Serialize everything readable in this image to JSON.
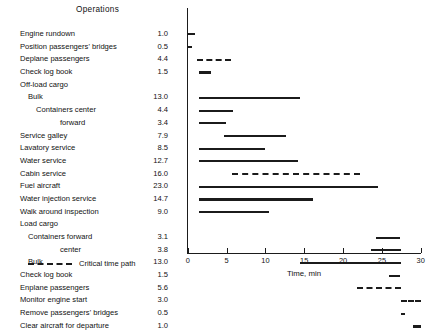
{
  "header": {
    "column_title": "Operations"
  },
  "axis": {
    "x_title": "Time, min",
    "x_ticks": [
      "0",
      "5",
      "10",
      "15",
      "20",
      "25",
      "30"
    ]
  },
  "legend": {
    "label": "Critical time path",
    "style": "dashed"
  },
  "rows": [
    {
      "label": "Engine rundown",
      "indent": 0,
      "value": "1.0"
    },
    {
      "label": "Position passengers' bridges",
      "indent": 0,
      "value": "0.5"
    },
    {
      "label": "Deplane passengers",
      "indent": 0,
      "value": "4.4"
    },
    {
      "label": "Check log book",
      "indent": 0,
      "value": "1.5"
    },
    {
      "label": "Off-load cargo",
      "indent": 0,
      "value": ""
    },
    {
      "label": "Bulk",
      "indent": 1,
      "value": "13.0"
    },
    {
      "label": "Containers center",
      "indent": 2,
      "value": "4.4"
    },
    {
      "label": "forward",
      "indent": 3,
      "value": "3.4"
    },
    {
      "label": "Service galley",
      "indent": 0,
      "value": "7.9"
    },
    {
      "label": "Lavatory service",
      "indent": 0,
      "value": "8.5"
    },
    {
      "label": "Water service",
      "indent": 0,
      "value": "12.7"
    },
    {
      "label": "Cabin service",
      "indent": 0,
      "value": "16.0"
    },
    {
      "label": "Fuel aircraft",
      "indent": 0,
      "value": "23.0"
    },
    {
      "label": "Water injection service",
      "indent": 0,
      "value": "14.7"
    },
    {
      "label": "Walk around inspection",
      "indent": 0,
      "value": "9.0"
    },
    {
      "label": "Load cargo",
      "indent": 0,
      "value": ""
    },
    {
      "label": "Containers forward",
      "indent": 1,
      "value": "3.1"
    },
    {
      "label": "center",
      "indent": 3,
      "value": "3.8"
    },
    {
      "label": "Bulk",
      "indent": 1,
      "value": "13.0"
    },
    {
      "label": "Check log book",
      "indent": 0,
      "value": "1.5"
    },
    {
      "label": "Enplane passengers",
      "indent": 0,
      "value": "5.6"
    },
    {
      "label": "Monitor engine start",
      "indent": 0,
      "value": "3.0"
    },
    {
      "label": "Remove passengers' bridges",
      "indent": 0,
      "value": "0.5"
    },
    {
      "label": "Clear aircraft for departure",
      "indent": 0,
      "value": "1.0"
    }
  ],
  "chart_data": {
    "type": "bar",
    "orientation": "horizontal-gantt",
    "title": "Operations",
    "xlabel": "Time, min",
    "ylabel": "",
    "xlim": [
      0,
      30
    ],
    "xticks": [
      0,
      5,
      10,
      15,
      20,
      25,
      30
    ],
    "grid": false,
    "legend": [
      {
        "name": "Critical time path",
        "style": "dashed"
      }
    ],
    "categories": [
      "Engine rundown",
      "Position passengers' bridges",
      "Deplane passengers",
      "Check log book",
      "Off-load cargo: Bulk",
      "Off-load cargo: Containers center",
      "Off-load cargo: Containers forward",
      "Service galley",
      "Lavatory service",
      "Water service",
      "Cabin service",
      "Fuel aircraft",
      "Water injection service",
      "Walk around inspection",
      "Load cargo: Containers forward",
      "Load cargo: Containers center",
      "Load cargo: Bulk",
      "Check log book",
      "Enplane passengers",
      "Monitor engine start",
      "Remove passengers' bridges",
      "Clear aircraft for departure"
    ],
    "durations": [
      1.0,
      0.5,
      4.4,
      1.5,
      13.0,
      4.4,
      3.4,
      7.9,
      8.5,
      12.7,
      16.0,
      23.0,
      14.7,
      9.0,
      3.1,
      3.8,
      13.0,
      1.5,
      5.6,
      3.0,
      0.5,
      1.0
    ],
    "bars": [
      {
        "row": 0,
        "start": 0.0,
        "end": 1.0,
        "critical": true
      },
      {
        "row": 1,
        "start": 0.0,
        "end": 0.5,
        "critical": false
      },
      {
        "row": 2,
        "start": 1.2,
        "end": 5.6,
        "critical": true
      },
      {
        "row": 3,
        "start": 1.5,
        "end": 3.0,
        "critical": false
      },
      {
        "row": 5,
        "start": 1.5,
        "end": 14.5,
        "critical": false
      },
      {
        "row": 6,
        "start": 1.5,
        "end": 5.9,
        "critical": false
      },
      {
        "row": 7,
        "start": 1.5,
        "end": 4.9,
        "critical": false
      },
      {
        "row": 8,
        "start": 4.7,
        "end": 12.6,
        "critical": false
      },
      {
        "row": 9,
        "start": 1.5,
        "end": 10.0,
        "critical": false
      },
      {
        "row": 10,
        "start": 1.5,
        "end": 14.2,
        "critical": false
      },
      {
        "row": 11,
        "start": 5.7,
        "end": 22.2,
        "critical": true
      },
      {
        "row": 12,
        "start": 1.5,
        "end": 24.5,
        "critical": false
      },
      {
        "row": 13,
        "start": 1.5,
        "end": 16.2,
        "critical": false
      },
      {
        "row": 14,
        "start": 1.5,
        "end": 10.5,
        "critical": false
      },
      {
        "row": 16,
        "start": 24.3,
        "end": 27.4,
        "critical": false
      },
      {
        "row": 17,
        "start": 23.6,
        "end": 27.4,
        "critical": false
      },
      {
        "row": 18,
        "start": 14.4,
        "end": 27.4,
        "critical": false
      },
      {
        "row": 19,
        "start": 25.9,
        "end": 27.4,
        "critical": false
      },
      {
        "row": 20,
        "start": 21.8,
        "end": 27.4,
        "critical": true
      },
      {
        "row": 21,
        "start": 27.4,
        "end": 30.0,
        "critical": true
      },
      {
        "row": 22,
        "start": 27.4,
        "end": 28.0,
        "critical": false
      },
      {
        "row": 23,
        "start": 29.0,
        "end": 30.0,
        "critical": false
      }
    ]
  }
}
